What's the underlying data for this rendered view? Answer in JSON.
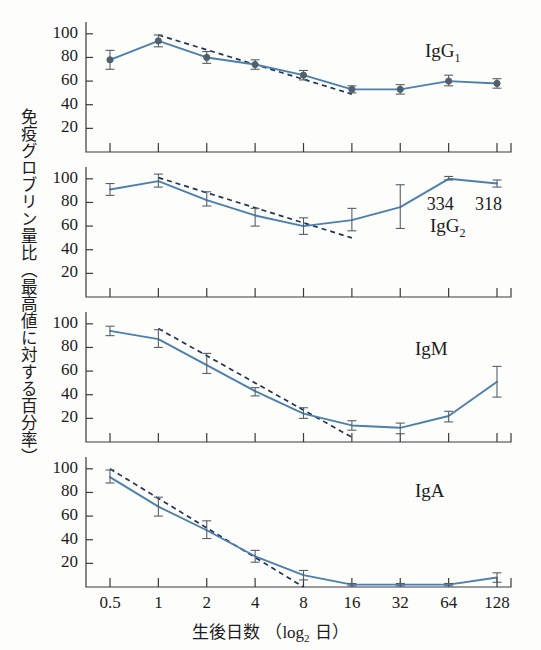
{
  "figure": {
    "ylabel": "免疫グロブリン量比（最高値に対する百分率）",
    "xlabel_pre": "生後日数 （",
    "xlabel_log": "log",
    "xlabel_sub": "2",
    "xlabel_post": " 日）"
  },
  "annotations": {
    "value_334": "334",
    "value_318": "318"
  },
  "colors": {
    "line": "#4a7fae",
    "marker": "#53606b",
    "trend": "#1f3352",
    "axis": "#3a3a3a",
    "text": "#1b1b1b",
    "background": "#fdfdfc"
  },
  "chart_data": {
    "type": "line",
    "title": "",
    "xlabel": "生後日数 （log2 日）",
    "ylabel": "免疫グロブリン量比（最高値に対する百分率）",
    "x": [
      0.5,
      1,
      2,
      4,
      8,
      16,
      32,
      64,
      128
    ],
    "xtick_labels": [
      "0.5",
      "1",
      "2",
      "4",
      "8",
      "16",
      "32",
      "64",
      "128"
    ],
    "xscale": "log2",
    "ytick_labels": [
      "20",
      "40",
      "60",
      "80",
      "100"
    ],
    "yticks": [
      20,
      40,
      60,
      80,
      100
    ],
    "ylim": [
      0,
      110
    ],
    "grid": false,
    "legend": "panel-annotation",
    "panels": [
      {
        "name": "IgG1",
        "label": "IgG",
        "label_sub": "1",
        "values": [
          78,
          94,
          80,
          74,
          65,
          53,
          53,
          60,
          58
        ],
        "err_low": [
          8,
          5,
          5,
          4,
          4,
          3,
          4,
          4,
          4
        ],
        "err_high": [
          8,
          5,
          5,
          4,
          4,
          3,
          4,
          5,
          4
        ],
        "trend_x": [
          1,
          16
        ],
        "trend_y": [
          99,
          49
        ],
        "extra_labels": []
      },
      {
        "name": "IgG2",
        "label": "IgG",
        "label_sub": "2",
        "values": [
          91,
          98,
          82,
          69,
          60,
          65,
          76,
          100,
          96
        ],
        "err_low": [
          5,
          5,
          5,
          9,
          7,
          9,
          18,
          1,
          3
        ],
        "err_high": [
          5,
          6,
          7,
          6,
          7,
          10,
          19,
          2,
          3
        ],
        "trend_x": [
          1,
          16
        ],
        "trend_y": [
          101,
          50
        ],
        "extra_labels": [
          {
            "text": "334",
            "x": 64
          },
          {
            "text": "318",
            "x": 128
          }
        ]
      },
      {
        "name": "IgM",
        "label": "IgM",
        "label_sub": "",
        "values": [
          94,
          87,
          65,
          43,
          24,
          14,
          12,
          22,
          51
        ],
        "err_low": [
          4,
          7,
          7,
          4,
          4,
          4,
          5,
          5,
          13
        ],
        "err_high": [
          4,
          8,
          10,
          3,
          5,
          4,
          4,
          4,
          13
        ],
        "trend_x": [
          1,
          16
        ],
        "trend_y": [
          96,
          4
        ],
        "extra_labels": []
      },
      {
        "name": "IgA",
        "label": "IgA",
        "label_sub": "",
        "values": [
          93,
          68,
          48,
          26,
          10,
          2,
          2,
          2,
          8
        ],
        "err_low": [
          5,
          8,
          7,
          5,
          4,
          1,
          1,
          1,
          4
        ],
        "err_high": [
          6,
          8,
          8,
          5,
          4,
          1,
          1,
          1,
          4
        ],
        "trend_x": [
          0.5,
          8
        ],
        "trend_y": [
          100,
          0
        ],
        "extra_labels": []
      }
    ]
  }
}
